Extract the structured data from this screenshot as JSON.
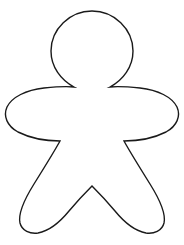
{
  "canvas": {
    "width": 184,
    "height": 245,
    "background_color": "#ffffff",
    "title": "Gingerbread Person Outline"
  },
  "figure": {
    "name": "gingerbread-person-outline",
    "fill_color": "#ffffff",
    "stroke_color": "#1a1a1a",
    "stroke_width": 1.4,
    "parts": [
      "head",
      "neck-left-cusp",
      "neck-right-cusp",
      "left-arm",
      "right-arm",
      "left-hip-cusp",
      "right-hip-cusp",
      "left-leg",
      "right-leg",
      "crotch-point"
    ],
    "anchors": {
      "head_center_x": 92,
      "head_center_y": 52,
      "head_radius": 41,
      "head_top_y": 11,
      "shoulder_y": 90,
      "arm_left_x": 5,
      "arm_right_x": 179,
      "arm_mid_y": 115,
      "hip_left_x": 60,
      "hip_right_x": 124,
      "hip_y": 141,
      "crotch_x": 92,
      "crotch_y": 190,
      "leg_bottom_y": 233,
      "leg_left_outer_x": 16,
      "leg_right_outer_x": 168
    },
    "path": "M 92 11 C 114 11 133 29 133 51 C 133 67 123 80 110 87 C 120 86 130 87 140 88 C 158 90 172 97 177 107 C 181 116 177 126 166 132 C 154 138 138 141 124 141 C 130 152 140 168 150 184 C 160 200 166 214 164 223 C 162 231 154 234 146 233 C 135 231 124 222 115 211 C 105 199 97 191 92 186 C 87 191 79 199 69 211 C 60 222 49 231 38 233 C 30 234 22 231 20 223 C 18 214 24 200 34 184 C 44 168 54 152 60 141 C 46 141 30 138 18 132 C 7 126 3 116 7 107 C 12 97 26 90 44 88 C 54 87 64 86 74 87 C 61 80 51 67 51 51 C 51 29 70 11 92 11 Z"
  }
}
